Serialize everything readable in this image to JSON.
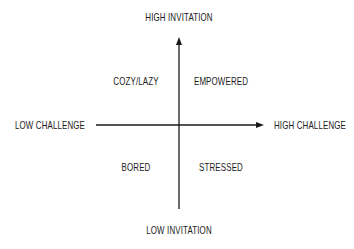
{
  "diagram": {
    "type": "quadrant",
    "axes": {
      "vertical": {
        "top_label": "HIGH INVITATION",
        "bottom_label": "LOW INVITATION"
      },
      "horizontal": {
        "left_label": "LOW CHALLENGE",
        "right_label": "HIGH CHALLENGE"
      }
    },
    "quadrants": {
      "top_left": "COZY/LAZY",
      "top_right": "EMPOWERED",
      "bottom_left": "BORED",
      "bottom_right": "STRESSED"
    },
    "colors": {
      "line": "#1a1a1a",
      "text": "#1a1a1a",
      "background": "#ffffff"
    }
  }
}
